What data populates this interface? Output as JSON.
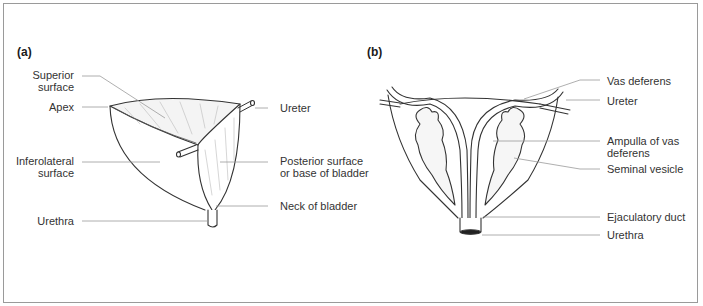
{
  "figure": {
    "panels": [
      {
        "id": "a",
        "label": "(a)",
        "subject": "Urinary bladder",
        "labels": {
          "superior_surface_1": "Superior",
          "superior_surface_2": "surface",
          "apex": "Apex",
          "inferolateral_surface_1": "Inferolateral",
          "inferolateral_surface_2": "surface",
          "urethra": "Urethra",
          "ureter": "Ureter",
          "posterior_surface_1": "Posterior surface",
          "posterior_surface_2": "or base of bladder",
          "neck": "Neck of bladder"
        }
      },
      {
        "id": "b",
        "label": "(b)",
        "subject": "Posterior view of bladder with seminal vesicles",
        "labels": {
          "vas_deferens": "Vas deferens",
          "ureter": "Ureter",
          "ampulla_1": "Ampulla of vas",
          "ampulla_2": "deferens",
          "seminal_vesicle": "Seminal vesicle",
          "ejaculatory_duct": "Ejaculatory duct",
          "urethra": "Urethra"
        }
      }
    ],
    "colors": {
      "line": "#333333",
      "leader": "#9a9a9a",
      "text": "#333333",
      "border": "#9a9a9a"
    }
  }
}
